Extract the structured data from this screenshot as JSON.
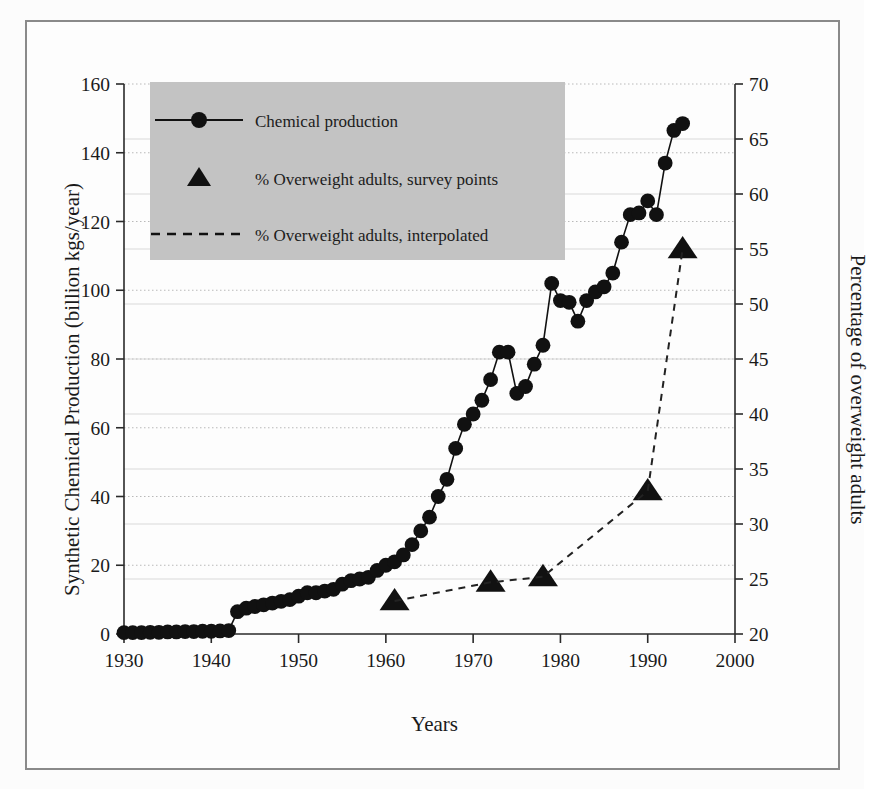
{
  "figure": {
    "background_color": "#fdfdfd",
    "frame_color": "#8a8a8a",
    "marker_color": "#111111",
    "legend_background": "#c3c3c3"
  },
  "axes": {
    "x_title": "Years",
    "y_left_title": "Synthetic Chemical Production (billion kgs/year)",
    "y_right_title": "Percentage of overweight adults"
  },
  "legend": {
    "entries": [
      {
        "label": "Chemical production",
        "marker": "circle-line"
      },
      {
        "label": "% Overweight adults, survey points",
        "marker": "triangle"
      },
      {
        "label": "% Overweight adults, interpolated",
        "marker": "dashed-line"
      }
    ]
  },
  "chart_data": {
    "type": "line",
    "title": "",
    "xlabel": "Years",
    "xlim": [
      1930,
      2000
    ],
    "xticks": [
      1930,
      1940,
      1950,
      1960,
      1970,
      1980,
      1990,
      2000
    ],
    "grid": true,
    "legend_position": "top-left",
    "axes": [
      {
        "id": "left",
        "label": "Synthetic Chemical Production (billion kgs/year)",
        "ylim": [
          0,
          160
        ],
        "yticks": [
          0,
          20,
          40,
          60,
          80,
          100,
          120,
          140,
          160
        ]
      },
      {
        "id": "right",
        "label": "Percentage of overweight adults",
        "ylim": [
          20,
          70
        ],
        "yticks": [
          20,
          25,
          30,
          35,
          40,
          45,
          50,
          55,
          60,
          65,
          70
        ]
      }
    ],
    "series": [
      {
        "name": "Chemical production",
        "axis": "left",
        "marker": "circle",
        "linestyle": "solid",
        "x": [
          1930,
          1931,
          1932,
          1933,
          1934,
          1935,
          1936,
          1937,
          1938,
          1939,
          1940,
          1941,
          1942,
          1943,
          1944,
          1945,
          1946,
          1947,
          1948,
          1949,
          1950,
          1951,
          1952,
          1953,
          1954,
          1955,
          1956,
          1957,
          1958,
          1959,
          1960,
          1961,
          1962,
          1963,
          1964,
          1965,
          1966,
          1967,
          1968,
          1969,
          1970,
          1971,
          1972,
          1973,
          1974,
          1975,
          1976,
          1977,
          1978,
          1979,
          1980,
          1981,
          1982,
          1983,
          1984,
          1985,
          1986,
          1987,
          1988,
          1989,
          1990,
          1991,
          1992,
          1993,
          1994
        ],
        "values": [
          0.4,
          0.4,
          0.4,
          0.5,
          0.5,
          0.6,
          0.6,
          0.7,
          0.7,
          0.8,
          0.8,
          0.9,
          1.0,
          6.5,
          7.5,
          8.0,
          8.5,
          9.0,
          9.5,
          10.0,
          11.0,
          12.0,
          12.0,
          12.5,
          13.0,
          14.5,
          15.5,
          16.0,
          16.5,
          18.5,
          20.0,
          21.0,
          23.0,
          26.0,
          30.0,
          34.0,
          40.0,
          45.0,
          54.0,
          61.0,
          64.0,
          68.0,
          74.0,
          82.0,
          82.0,
          70.0,
          72.0,
          78.5,
          84.0,
          102.0,
          97.0,
          96.5,
          91.0,
          97.0,
          99.5,
          101.0,
          105.0,
          114.0,
          122.0,
          122.5,
          126.0,
          122.0,
          137.0,
          146.5,
          148.5
        ]
      },
      {
        "name": "% Overweight adults, survey points",
        "axis": "right",
        "marker": "triangle",
        "linestyle": "none",
        "x": [
          1961,
          1972,
          1978,
          1990,
          1994
        ],
        "values": [
          23.0,
          24.7,
          25.2,
          33.0,
          55.0
        ]
      },
      {
        "name": "% Overweight adults, interpolated",
        "axis": "right",
        "marker": "none",
        "linestyle": "dashed",
        "x": [
          1961,
          1972,
          1978,
          1990,
          1994
        ],
        "values": [
          23.0,
          24.7,
          25.2,
          33.0,
          55.0
        ]
      }
    ]
  }
}
